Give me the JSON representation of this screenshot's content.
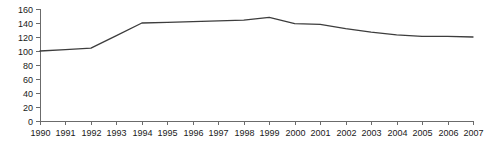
{
  "chart_data": {
    "type": "line",
    "title": "",
    "subtitle": "",
    "xlabel": "",
    "ylabel": "",
    "categories": [
      "1990",
      "1991",
      "1992",
      "1993",
      "1994",
      "1995",
      "1996",
      "1997",
      "1998",
      "1999",
      "2000",
      "2001",
      "2002",
      "2003",
      "2004",
      "2005",
      "2006",
      "2007"
    ],
    "x": [
      1990,
      1991,
      1992,
      1993,
      1994,
      1995,
      1996,
      1997,
      1998,
      1999,
      2000,
      2001,
      2002,
      2003,
      2004,
      2005,
      2006,
      2007
    ],
    "values": [
      100,
      102,
      104,
      122,
      140,
      141,
      142,
      143,
      144,
      148,
      139,
      138,
      132,
      127,
      123,
      121,
      121,
      120
    ],
    "series": [
      {
        "name": "index",
        "values": [
          100,
          102,
          104,
          122,
          140,
          141,
          142,
          143,
          144,
          148,
          139,
          138,
          132,
          127,
          123,
          121,
          121,
          120
        ]
      }
    ],
    "ylim": [
      0,
      160
    ],
    "xlim": [
      1990,
      2007
    ],
    "y_ticks": [
      0,
      20,
      40,
      60,
      80,
      100,
      120,
      140,
      160
    ],
    "y_tick_labels": [
      "0",
      "20",
      "40",
      "60",
      "80",
      "100",
      "120",
      "140",
      "160"
    ],
    "x_ticks": [
      1990,
      1991,
      1992,
      1993,
      1994,
      1995,
      1996,
      1997,
      1998,
      1999,
      2000,
      2001,
      2002,
      2003,
      2004,
      2005,
      2006,
      2007
    ],
    "x_tick_labels": [
      "1990",
      "1991",
      "1992",
      "1993",
      "1994",
      "1995",
      "1996",
      "1997",
      "1998",
      "1999",
      "2000",
      "2001",
      "2002",
      "2003",
      "2004",
      "2005",
      "2006",
      "2007"
    ],
    "grid": false,
    "legend": false,
    "legend_position": "none",
    "annotations": [],
    "colors": {
      "line": "#3d3d3d",
      "axis": "#6b6b6b",
      "text": "#1a1a1a",
      "background": "#ffffff"
    }
  },
  "layout": {
    "width": 497,
    "height": 148,
    "plot_left": 40,
    "plot_right": 473,
    "plot_top": 9,
    "plot_bottom": 121,
    "x_label_y": 136,
    "tick_len": 4
  }
}
